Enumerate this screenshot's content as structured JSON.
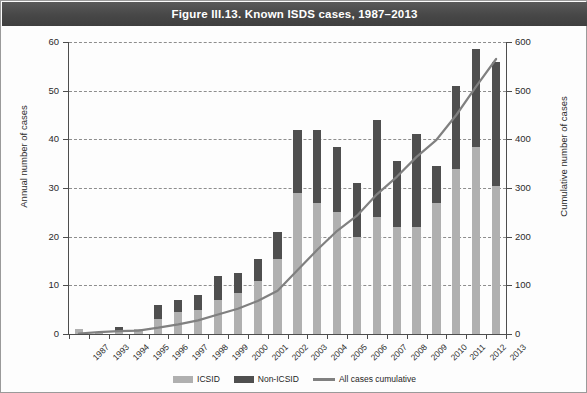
{
  "figure": {
    "title": "Figure III.13. Known ISDS cases, 1987–2013",
    "title_bar_color": "#4a4a4a",
    "background_color": "#fdfdfd",
    "border_color": "#9a9a9a"
  },
  "legend": {
    "position": "bottom-center",
    "items": [
      {
        "label": "ICSID",
        "marker": "swatch",
        "color": "#b0b0b0"
      },
      {
        "label": "Non-ICSID",
        "marker": "swatch",
        "color": "#4f4f4f"
      },
      {
        "label": "All cases cumulative",
        "marker": "line",
        "color": "#808080"
      }
    ]
  },
  "chart_data": {
    "type": "bar",
    "title": "Figure III.13. Known ISDS cases, 1987–2013",
    "xlabel": "",
    "ylabel": "Annual number of cases",
    "y2label": "Cumulative number of cases",
    "ylim": [
      0,
      60
    ],
    "y2lim": [
      0,
      600
    ],
    "yticks": [
      0,
      10,
      20,
      30,
      40,
      50,
      60
    ],
    "y2ticks": [
      0,
      100,
      200,
      300,
      400,
      500,
      600
    ],
    "grid": true,
    "stacked": true,
    "categories": [
      "1987",
      "1993",
      "1994",
      "1995",
      "1996",
      "1997",
      "1998",
      "1999",
      "2000",
      "2001",
      "2002",
      "2003",
      "2004",
      "2005",
      "2006",
      "2007",
      "2008",
      "2009",
      "2010",
      "2011",
      "2012",
      "2013"
    ],
    "series": [
      {
        "name": "ICSID",
        "type": "bar",
        "axis": "left",
        "color": "#b0b0b0",
        "values": [
          1,
          0.5,
          0.5,
          1,
          3,
          4.5,
          5,
          7,
          8.5,
          11,
          15.5,
          29,
          27,
          25,
          20,
          24,
          22,
          22,
          27,
          34,
          38.5,
          30.5
        ]
      },
      {
        "name": "Non-ICSID",
        "type": "bar",
        "axis": "left",
        "color": "#4f4f4f",
        "values": [
          0,
          0,
          1,
          0,
          3,
          2.5,
          3,
          5,
          4,
          4.5,
          5.5,
          13,
          15,
          13.5,
          11,
          20,
          13.5,
          19,
          7.5,
          17,
          20,
          25.5
        ]
      },
      {
        "name": "All cases cumulative",
        "type": "line",
        "axis": "right",
        "color": "#808080",
        "values": [
          1,
          4,
          6,
          7,
          13,
          20,
          28,
          40,
          52,
          68,
          89,
          131,
          173,
          212,
          243,
          287,
          323,
          364,
          399,
          450,
          509,
          565
        ]
      }
    ],
    "bar_totals": [
      1,
      0.5,
      1.5,
      1,
      6,
      7,
      8,
      12,
      12.5,
      15.5,
      21,
      42,
      42,
      38.5,
      31,
      44,
      35.5,
      41,
      34.5,
      51,
      58.5,
      56
    ]
  },
  "axes": {
    "left": {
      "title": "Annual number of cases",
      "tick_labels": [
        "60",
        "50",
        "40",
        "30",
        "20",
        "10",
        "0"
      ]
    },
    "right": {
      "title": "Cumulative number of cases",
      "tick_labels": [
        "600",
        "500",
        "400",
        "300",
        "200",
        "100",
        "0"
      ]
    },
    "bottom": {
      "tick_labels": [
        "1987",
        "1993",
        "1994",
        "1995",
        "1996",
        "1997",
        "1998",
        "1999",
        "2000",
        "2001",
        "2002",
        "2003",
        "2004",
        "2005",
        "2006",
        "2007",
        "2008",
        "2009",
        "2010",
        "2011",
        "2012",
        "2013"
      ]
    }
  }
}
